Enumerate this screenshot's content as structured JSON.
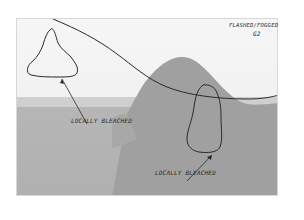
{
  "image": {
    "description": "Annotated grayscale landscape photograph with a large hill, hand-drawn outlines and handwritten labels",
    "annotations": [
      {
        "id": "flashed",
        "text_line1": "FLASHED/FOGGED",
        "text_line2": "G2"
      },
      {
        "id": "bleached_sky",
        "text": "LOCALLY BLEACHED"
      },
      {
        "id": "bleached_hill",
        "text": "LOCALLY BLEACHED"
      }
    ],
    "colors": {
      "sky": "#f3f3f3",
      "hill": "#9e9e9e",
      "foreground": "#b4b4b4",
      "ink": "#2a2a2a"
    }
  }
}
